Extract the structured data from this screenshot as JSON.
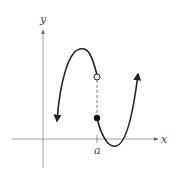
{
  "figure": {
    "type": "function-graph",
    "axes": {
      "x_label": "x",
      "y_label": "y",
      "tick_label": "a"
    },
    "left_branch": {
      "shape": "downward-opening arc with maximum",
      "endpoint_at_a": "open",
      "left_end": "arrow-down"
    },
    "right_branch": {
      "shape": "upward-opening arc with minimum below x-axis",
      "endpoint_at_a": "closed",
      "right_end": "arrow-up"
    },
    "connector": "dashed vertical line at x = a",
    "colors": {
      "curve": "#222222",
      "axes": "#888888",
      "labels": "#444444"
    }
  }
}
